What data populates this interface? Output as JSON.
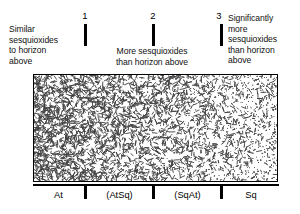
{
  "figure": {
    "top_notes": [
      {
        "id": "left",
        "text": "Similar\nsesquioxides\nto horizon\nabove"
      },
      {
        "id": "middle",
        "text": "More sesquioxides\nthan horizon above"
      },
      {
        "id": "right",
        "text": "Significantly\nmore\nsesquioxides\nthan horizon\nabove"
      }
    ],
    "top_ticks": [
      {
        "label": "1",
        "x_px": 84
      },
      {
        "label": "2",
        "x_px": 152
      },
      {
        "label": "3",
        "x_px": 220
      }
    ],
    "axis_labels": [
      "At",
      "(AtSq)",
      "(SqAt)",
      "Sq"
    ],
    "bottom_ticks": [
      {
        "x_px": 84
      },
      {
        "x_px": 152
      },
      {
        "x_px": 220
      }
    ],
    "colors": {
      "ink": "#000000",
      "texture": "#3a3a3a",
      "background": "#ffffff"
    }
  },
  "chart_data": {
    "type": "bar",
    "xlabel": "",
    "ylabel": "",
    "grid": false,
    "legend": null,
    "categories": [
      "At",
      "(AtSq)",
      "(SqAt)",
      "Sq"
    ],
    "values": [
      1,
      2,
      3,
      4
    ],
    "category_boundaries_px": [
      33,
      84,
      152,
      220,
      278
    ],
    "scale_points": [
      {
        "label": "1",
        "x_px": 84,
        "meaning": "Similar sesquioxides to horizon above"
      },
      {
        "label": "2",
        "x_px": 152,
        "meaning": "More sesquioxides than horizon above"
      },
      {
        "label": "3",
        "x_px": 220,
        "meaning": "Significantly more sesquioxides than horizon above"
      }
    ],
    "texture_gradient": {
      "description": "Short dash texture dense at left, thinning rightward; fine stipple increasing to the right",
      "dash_density_left": 1.0,
      "dash_density_right": 0.08,
      "stipple_density_left": 0.05,
      "stipple_density_right": 1.0
    }
  }
}
